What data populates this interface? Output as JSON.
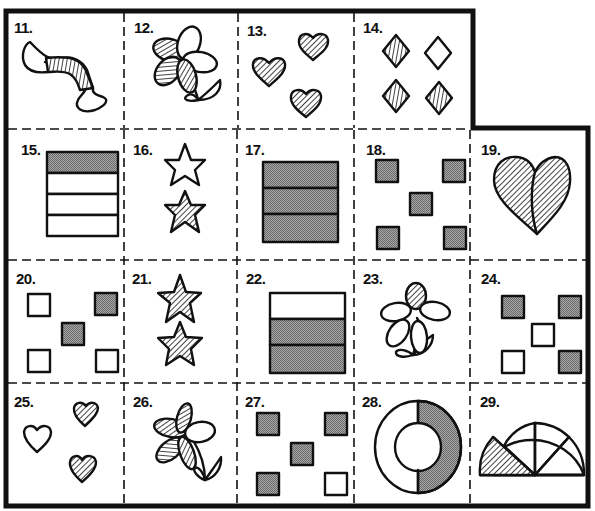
{
  "worksheet": {
    "colors": {
      "ink": "#111111",
      "gray_fill": "#8f8f8f",
      "paper": "#ffffff"
    },
    "cells": [
      {
        "number": "11.",
        "label": "worm-half-striped"
      },
      {
        "number": "12.",
        "label": "flower-three-striped-petals"
      },
      {
        "number": "13.",
        "label": "three-striped-hearts"
      },
      {
        "number": "14.",
        "label": "diamonds-three-striped-one-plain"
      },
      {
        "number": "15.",
        "label": "rectangle-one-of-four-gray"
      },
      {
        "number": "16.",
        "label": "stars-one-plain-one-striped"
      },
      {
        "number": "17.",
        "label": "rectangle-three-of-three-gray"
      },
      {
        "number": "18.",
        "label": "five-gray-squares"
      },
      {
        "number": "19.",
        "label": "heart-both-halves-striped"
      },
      {
        "number": "20.",
        "label": "squares-two-gray-three-plain"
      },
      {
        "number": "21.",
        "label": "two-striped-stars"
      },
      {
        "number": "22.",
        "label": "rectangle-two-of-three-gray"
      },
      {
        "number": "23.",
        "label": "flower-one-striped-petal"
      },
      {
        "number": "24.",
        "label": "squares-three-gray-two-plain"
      },
      {
        "number": "25.",
        "label": "hearts-two-striped-one-plain"
      },
      {
        "number": "26.",
        "label": "flower-four-striped-petals"
      },
      {
        "number": "27.",
        "label": "squares-four-gray-one-plain"
      },
      {
        "number": "28.",
        "label": "ring-half-gray"
      },
      {
        "number": "29.",
        "label": "semicircle-one-of-four-striped"
      }
    ]
  }
}
